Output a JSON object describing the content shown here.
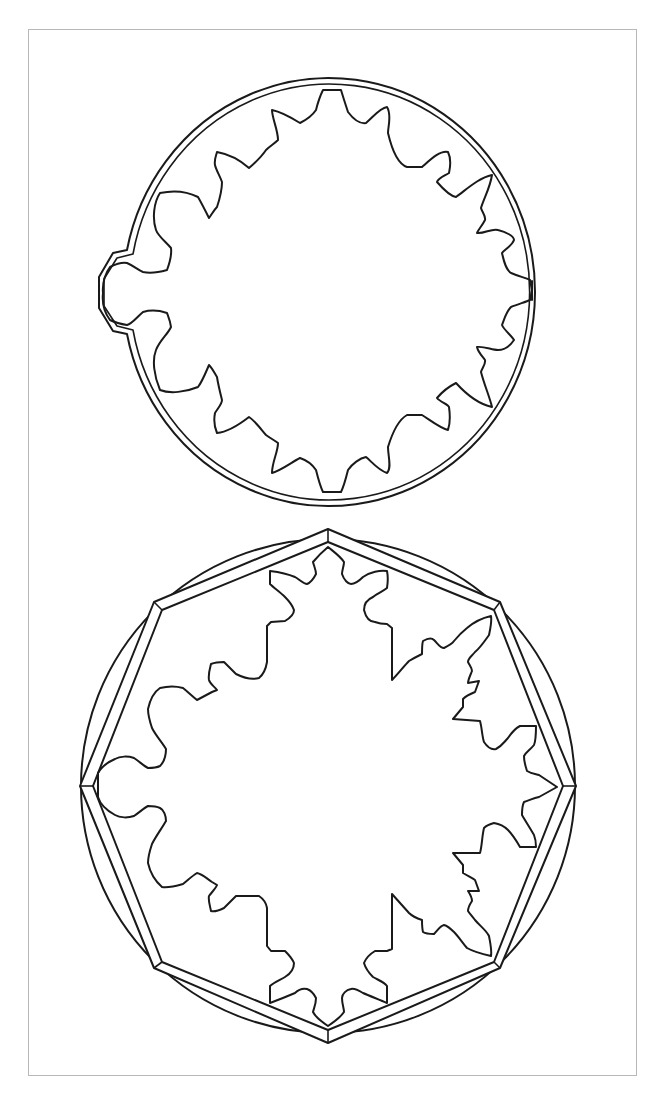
{
  "figure": {
    "frame_color": "#b8b8b8",
    "line_color": "#1a1a1a",
    "background": "#ffffff",
    "shapes": [
      {
        "name": "ornamental-ellipse",
        "outer_ellipse": {
          "cx": 332,
          "cy": 292,
          "rx": 206,
          "ry": 214
        },
        "inner_ellipse": {
          "cx": 332,
          "cy": 292,
          "rx": 201,
          "ry": 209
        },
        "tab": "octagonal tab on left side",
        "inner_motif": "scalloped gear-like cutout"
      },
      {
        "name": "ornamental-octagon",
        "circle": {
          "cx": 328,
          "cy": 786,
          "r": 247
        },
        "outer_octagon": "328,529 500,602 576,786 500,968 328,1043 154,968 80,786 154,602",
        "inner_octagon": "328,542 494,610 563,786 494,962 328,1030 162,962 93,786 162,610",
        "inner_motif": "scalloped star-like cutout"
      }
    ]
  }
}
